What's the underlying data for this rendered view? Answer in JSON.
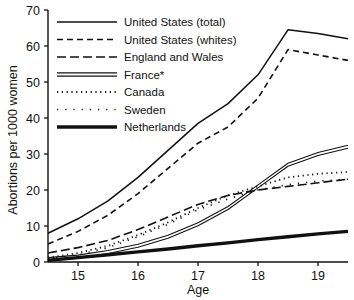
{
  "chart_data": {
    "type": "line",
    "title": "",
    "xlabel": "Age",
    "ylabel": "Abortions per 1000 women",
    "xlim": [
      14.5,
      19.5
    ],
    "ylim": [
      0,
      70
    ],
    "xticks": [
      "15",
      "16",
      "17",
      "18",
      "19"
    ],
    "xtick_values": [
      15,
      16,
      17,
      18,
      19
    ],
    "yticks": [
      "0",
      "10",
      "20",
      "30",
      "40",
      "50",
      "60",
      "70"
    ],
    "ytick_values": [
      0,
      10,
      20,
      30,
      40,
      50,
      60,
      70
    ],
    "grid": false,
    "legend_position": "upper-left-inside",
    "footnote": "*",
    "x": [
      14.5,
      15,
      15.5,
      16,
      16.5,
      17,
      17.5,
      18,
      18.5,
      19,
      19.5
    ],
    "series": [
      {
        "name": "United States (total)",
        "style": "solid-thin",
        "values": [
          8.0,
          12.0,
          17.0,
          23.5,
          31.0,
          38.5,
          44.0,
          52.0,
          64.5,
          63.5,
          62.0
        ]
      },
      {
        "name": "United States (whites)",
        "style": "dashed-short",
        "values": [
          5.0,
          8.5,
          13.0,
          19.0,
          26.0,
          33.0,
          37.5,
          45.5,
          59.0,
          57.5,
          56.0
        ]
      },
      {
        "name": "England and Wales",
        "style": "dashed-long",
        "values": [
          2.5,
          4.0,
          6.0,
          9.0,
          12.5,
          16.0,
          18.5,
          20.0,
          21.0,
          22.0,
          23.0
        ]
      },
      {
        "name": "France*",
        "style": "double-line",
        "values": [
          0.8,
          1.5,
          2.8,
          4.5,
          7.0,
          10.5,
          15.0,
          21.0,
          27.0,
          30.0,
          32.0
        ]
      },
      {
        "name": "Canada",
        "style": "dotted-fine",
        "values": [
          1.2,
          2.5,
          4.5,
          7.5,
          11.0,
          15.0,
          18.5,
          21.0,
          23.5,
          24.5,
          25.0
        ]
      },
      {
        "name": "Sweden",
        "style": "dotted-sparse",
        "values": [
          1.0,
          2.0,
          4.0,
          7.0,
          10.5,
          14.5,
          17.5,
          20.0,
          21.5,
          22.5,
          23.0
        ]
      },
      {
        "name": "Netherlands",
        "style": "solid-thick",
        "values": [
          0.5,
          1.2,
          2.0,
          2.8,
          3.6,
          4.5,
          5.3,
          6.2,
          7.0,
          7.8,
          8.5
        ]
      }
    ]
  },
  "legend": {
    "items": [
      {
        "label": "United States (total)",
        "style": "solid-thin"
      },
      {
        "label": "United States (whites)",
        "style": "dashed-short"
      },
      {
        "label": "England and Wales",
        "style": "dashed-long"
      },
      {
        "label": "France*",
        "style": "double-line"
      },
      {
        "label": "Canada",
        "style": "dotted-fine"
      },
      {
        "label": "Sweden",
        "style": "dotted-sparse"
      },
      {
        "label": "Netherlands",
        "style": "solid-thick"
      }
    ]
  },
  "colors": {
    "ink": "#111111",
    "background": "#ffffff"
  }
}
